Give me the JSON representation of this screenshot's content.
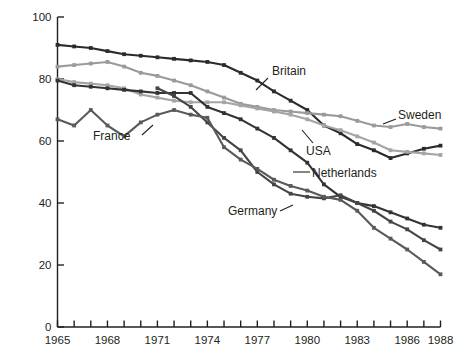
{
  "chart_data": {
    "type": "line",
    "title": "",
    "xlabel": "",
    "ylabel": "Percentage of men aged 60-64 in labor force",
    "xlim": [
      1965,
      1988
    ],
    "ylim": [
      0,
      100
    ],
    "yticks": [
      0,
      20,
      40,
      60,
      80,
      100
    ],
    "xticks": [
      1965,
      1966,
      1967,
      1968,
      1969,
      1970,
      1971,
      1972,
      1973,
      1974,
      1975,
      1976,
      1977,
      1978,
      1979,
      1980,
      1981,
      1982,
      1983,
      1984,
      1985,
      1986,
      1987,
      1988
    ],
    "xtick_labels": [
      "1965",
      "",
      "",
      "1968",
      "",
      "",
      "1971",
      "",
      "",
      "1974",
      "",
      "",
      "1977",
      "",
      "",
      "1980",
      "",
      "",
      "1983",
      "",
      "",
      "1986",
      "",
      "1988"
    ],
    "grid": false,
    "legend_position": "inline-annotations",
    "markers": true,
    "series": [
      {
        "name": "Britain",
        "color": "#2b2b2b",
        "x": [
          1965,
          1966,
          1967,
          1968,
          1969,
          1970,
          1971,
          1972,
          1973,
          1974,
          1975,
          1976,
          1977,
          1978,
          1979,
          1980,
          1981,
          1982,
          1983,
          1984,
          1985,
          1986,
          1987,
          1988
        ],
        "values": [
          91,
          90.5,
          90,
          89,
          88,
          87.5,
          87,
          86.5,
          86,
          85.5,
          84.5,
          82,
          79.5,
          76,
          73,
          70,
          65,
          62.5,
          59,
          57,
          54.5,
          56,
          57.5,
          58.5
        ]
      },
      {
        "name": "Sweden",
        "color": "#9a9a9a",
        "x": [
          1965,
          1966,
          1967,
          1968,
          1969,
          1970,
          1971,
          1972,
          1973,
          1974,
          1975,
          1976,
          1977,
          1978,
          1979,
          1980,
          1981,
          1982,
          1983,
          1984,
          1985,
          1986,
          1987,
          1988
        ],
        "values": [
          84,
          84.5,
          85,
          85.5,
          84,
          82,
          81,
          79.5,
          78,
          76,
          74,
          72,
          71,
          70,
          69.5,
          69,
          68.5,
          68,
          66.5,
          65,
          64.5,
          65.5,
          64.5,
          64
        ]
      },
      {
        "name": "USA",
        "color": "#a5a5a5",
        "x": [
          1965,
          1966,
          1967,
          1968,
          1969,
          1970,
          1971,
          1972,
          1973,
          1974,
          1975,
          1976,
          1977,
          1978,
          1979,
          1980,
          1981,
          1982,
          1983,
          1984,
          1985,
          1986,
          1987,
          1988
        ],
        "values": [
          80,
          79,
          78.5,
          78,
          77,
          75,
          74,
          73,
          72.5,
          72.5,
          72.5,
          71.5,
          70.5,
          69.5,
          68.5,
          67,
          65,
          63.5,
          61.5,
          59.5,
          57,
          56.5,
          56,
          55.5
        ]
      },
      {
        "name": "Netherlands",
        "color": "#333333",
        "x": [
          1965,
          1966,
          1967,
          1968,
          1969,
          1970,
          1971,
          1972,
          1973,
          1974,
          1975,
          1976,
          1977,
          1978,
          1979,
          1980,
          1981,
          1982,
          1983,
          1984,
          1985,
          1986,
          1987,
          1988
        ],
        "values": [
          79.5,
          78,
          77.5,
          77,
          76.5,
          76,
          75.5,
          75.5,
          75.5,
          71,
          69,
          67,
          64,
          61,
          57,
          53,
          46,
          42,
          40,
          39,
          37,
          35,
          33,
          32
        ]
      },
      {
        "name": "Germany",
        "color": "#454545",
        "x": [
          1971,
          1972,
          1973,
          1974,
          1975,
          1976,
          1977,
          1978,
          1979,
          1980,
          1981,
          1982,
          1983,
          1984,
          1985,
          1986,
          1987,
          1988
        ],
        "values": [
          77,
          74.5,
          71,
          66,
          61,
          57,
          50,
          46,
          43,
          42,
          41.5,
          42.5,
          40,
          37.5,
          34,
          31.5,
          28,
          25
        ]
      },
      {
        "name": "France",
        "color": "#5a5a5a",
        "x": [
          1965,
          1966,
          1967,
          1968,
          1969,
          1970,
          1971,
          1972,
          1973,
          1974,
          1975,
          1976,
          1977,
          1978,
          1979,
          1980,
          1981,
          1982,
          1983,
          1984,
          1985,
          1986,
          1987,
          1988
        ],
        "values": [
          67,
          65,
          70,
          65,
          61.5,
          66,
          68.5,
          70,
          68.5,
          67.5,
          58,
          54,
          51,
          47.5,
          45.5,
          44,
          42,
          41,
          37.5,
          32,
          28.5,
          25,
          21,
          17
        ]
      }
    ],
    "annotations": [
      {
        "text": "Britain",
        "anchor_x": 1977,
        "anchor_y": 79.5
      },
      {
        "text": "Sweden",
        "anchor_x": 1985,
        "anchor_y": 64.5
      },
      {
        "text": "USA",
        "anchor_x": 1980,
        "anchor_y": 67
      },
      {
        "text": "Netherlands",
        "anchor_x": 1979,
        "anchor_y": 57
      },
      {
        "text": "Germany",
        "anchor_x": 1981,
        "anchor_y": 41.5
      },
      {
        "text": "France",
        "anchor_x": 1973,
        "anchor_y": 68.5
      }
    ]
  },
  "labels": {
    "ylabel": "Percentage of men aged 60-64 in labor force",
    "britain": "Britain",
    "sweden": "Sweden",
    "usa": "USA",
    "netherlands": "Netherlands",
    "germany": "Germany",
    "france": "France"
  },
  "colors": {
    "axis": "#231f20",
    "text": "#231f20",
    "background": "#ffffff"
  }
}
